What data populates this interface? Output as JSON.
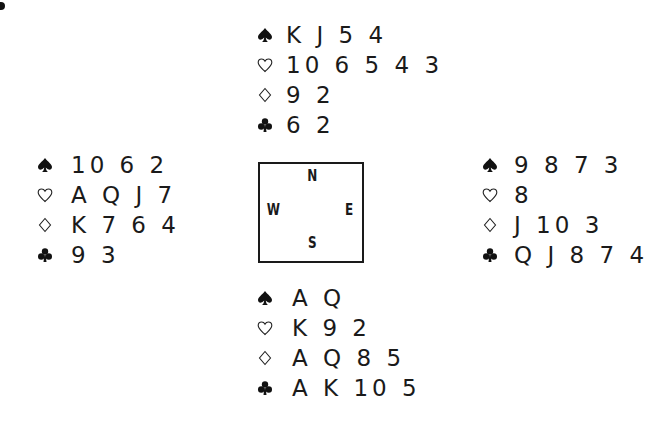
{
  "diagram": {
    "type": "bridge-deal",
    "compass": {
      "north": "N",
      "west": "W",
      "east": "E",
      "south": "S"
    },
    "hands": {
      "north": {
        "spades": "K J 5 4",
        "hearts": "10 6 5 4 3",
        "diamonds": "9 2",
        "clubs": "6 2"
      },
      "west": {
        "spades": "10 6 2",
        "hearts": "A Q J 7",
        "diamonds": "K 7 6 4",
        "clubs": "9 3"
      },
      "east": {
        "spades": "9 8 7 3",
        "hearts": "8",
        "diamonds": "J 10 3",
        "clubs": "Q J 8 7 4"
      },
      "south": {
        "spades": "A Q",
        "hearts": "K 9 2",
        "diamonds": "A Q 8 5",
        "clubs": "A K 10 5"
      }
    },
    "suit_icons": {
      "spades": "spade-icon",
      "hearts": "heart-outline-icon",
      "diamonds": "diamond-outline-icon",
      "clubs": "club-icon"
    }
  }
}
